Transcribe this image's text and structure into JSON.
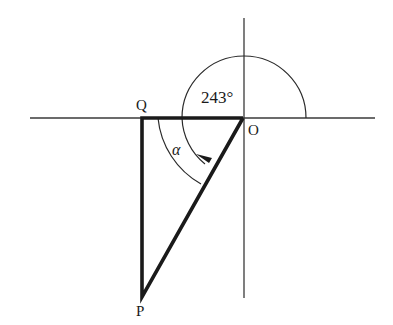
{
  "diagram": {
    "type": "geometry-bearing",
    "points": {
      "O": {
        "label": "O",
        "x": 243,
        "y": 118
      },
      "Q": {
        "label": "Q",
        "x": 142,
        "y": 118
      },
      "P": {
        "label": "P",
        "x": 142,
        "y": 297
      }
    },
    "angle_labels": {
      "bearing": "243°",
      "alpha": "α"
    },
    "colors": {
      "axis": "#3a3a3a",
      "triangle": "#1a1a1a",
      "arc": "#2a2a2a",
      "background": "#ffffff"
    }
  }
}
